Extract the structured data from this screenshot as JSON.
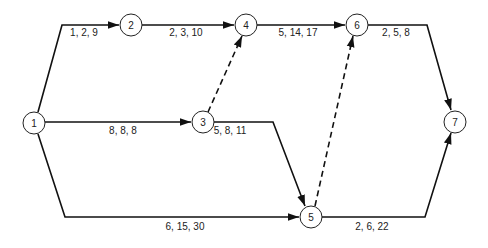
{
  "diagram": {
    "type": "network-activity-diagram",
    "nodes": [
      {
        "id": "1",
        "label": "1",
        "x": 34,
        "y": 123
      },
      {
        "id": "2",
        "label": "2",
        "x": 131,
        "y": 25
      },
      {
        "id": "3",
        "label": "3",
        "x": 203,
        "y": 122
      },
      {
        "id": "4",
        "label": "4",
        "x": 246,
        "y": 25
      },
      {
        "id": "5",
        "label": "5",
        "x": 311,
        "y": 217
      },
      {
        "id": "6",
        "label": "6",
        "x": 357,
        "y": 25
      },
      {
        "id": "7",
        "label": "7",
        "x": 455,
        "y": 122
      }
    ],
    "edges": [
      {
        "from": "1",
        "to": "2",
        "label": "1, 2, 9",
        "style": "solid"
      },
      {
        "from": "2",
        "to": "4",
        "label": "2, 3, 10",
        "style": "solid"
      },
      {
        "from": "4",
        "to": "6",
        "label": "5, 14, 17",
        "style": "solid"
      },
      {
        "from": "6",
        "to": "7",
        "label": "2, 5, 8",
        "style": "solid"
      },
      {
        "from": "1",
        "to": "3",
        "label": "8, 8, 8",
        "style": "solid"
      },
      {
        "from": "3",
        "to": "4",
        "label": "",
        "style": "dashed"
      },
      {
        "from": "3",
        "to": "5",
        "label": "5, 8, 11",
        "style": "solid"
      },
      {
        "from": "1",
        "to": "5",
        "label": "6, 15, 30",
        "style": "solid"
      },
      {
        "from": "5",
        "to": "6",
        "label": "",
        "style": "dashed"
      },
      {
        "from": "5",
        "to": "7",
        "label": "2, 6, 22",
        "style": "solid"
      }
    ]
  }
}
